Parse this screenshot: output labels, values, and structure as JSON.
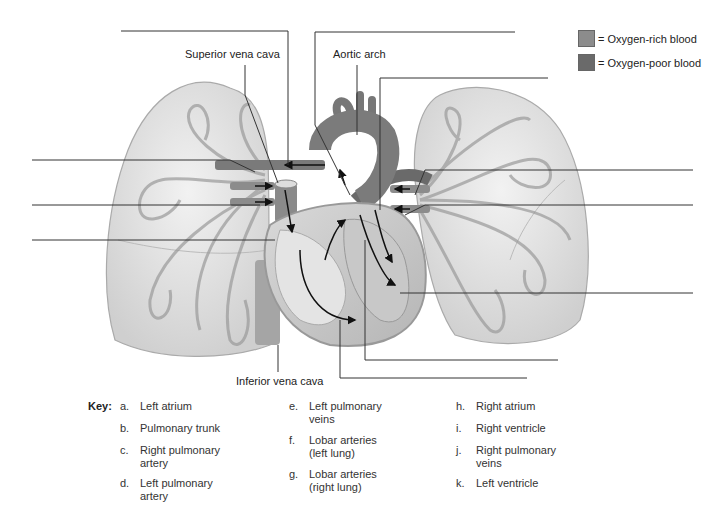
{
  "legend": {
    "items": [
      {
        "label": "= Oxygen-rich blood",
        "color": "#8c8c8c"
      },
      {
        "label": "= Oxygen-poor blood",
        "color": "#6a6a6a"
      }
    ]
  },
  "labels": {
    "superior_vena_cava": "Superior vena cava",
    "aortic_arch": "Aortic arch",
    "inferior_vena_cava": "Inferior vena cava"
  },
  "key": {
    "title": "Key:",
    "items": [
      {
        "letter": "a.",
        "text": "Left atrium"
      },
      {
        "letter": "b.",
        "text": "Pulmonary trunk"
      },
      {
        "letter": "c.",
        "text": "Right pulmonary\nartery"
      },
      {
        "letter": "d.",
        "text": "Left pulmonary\nartery"
      },
      {
        "letter": "e.",
        "text": "Left pulmonary\nveins"
      },
      {
        "letter": "f.",
        "text": "Lobar arteries\n(left lung)"
      },
      {
        "letter": "g.",
        "text": "Lobar arteries\n(right lung)"
      },
      {
        "letter": "h.",
        "text": "Right atrium"
      },
      {
        "letter": "i.",
        "text": "Right ventricle"
      },
      {
        "letter": "j.",
        "text": "Right pulmonary\nveins"
      },
      {
        "letter": "k.",
        "text": "Left ventricle"
      }
    ]
  },
  "blank_leaders": 11
}
